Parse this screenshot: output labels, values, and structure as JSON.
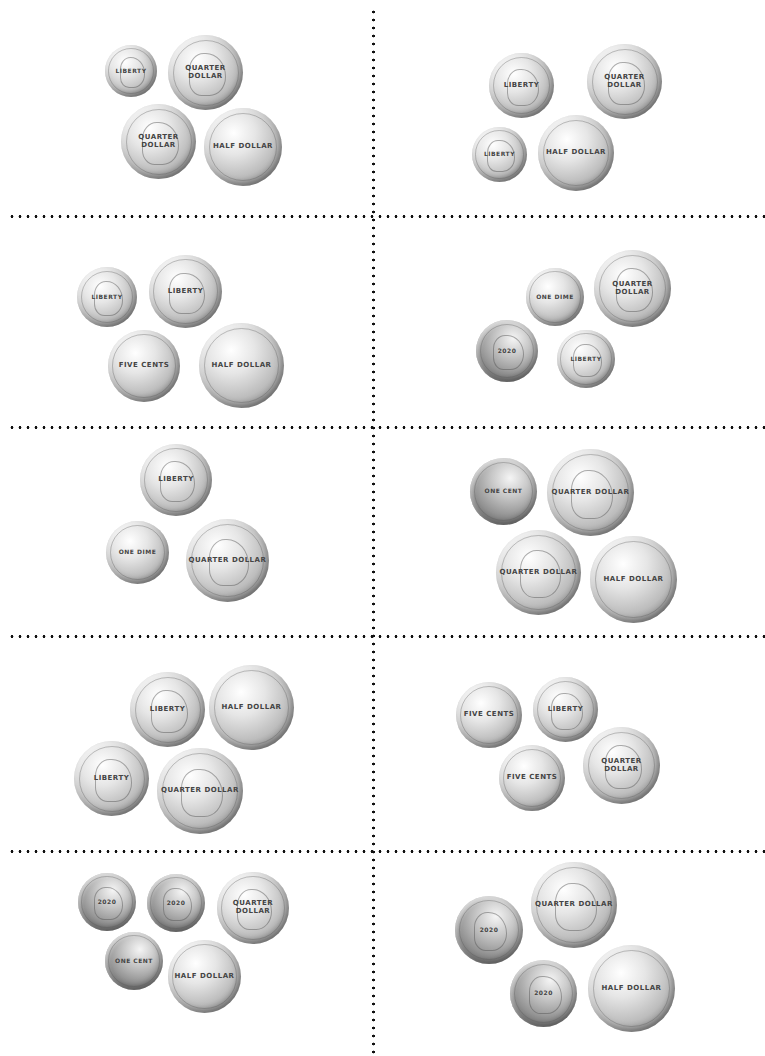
{
  "worksheet": {
    "title": "Coin counting cut-out cards",
    "grid": {
      "columns": 2,
      "rows": 5
    },
    "divider_style": "dotted",
    "colors": {
      "background": "#ffffff",
      "divider": "#111111",
      "coin_silver": "#bdbdbd"
    }
  },
  "coin_labels": {
    "penny_heads": "2020",
    "penny_tails": "ONE CENT",
    "nickel_heads": "Liberty 2020",
    "nickel_tails": "FIVE CENTS",
    "dime_heads": "LIBERTY",
    "dime_tails": "ONE DIME",
    "quarter_heads": "UNITED STATES QUARTER DOLLAR",
    "half_tails": "UNITED STATES HALF DOLLAR"
  },
  "cards": [
    {
      "id": 1,
      "coins": [
        {
          "type": "dime",
          "side": "heads",
          "label": "LIBERTY",
          "x": 105,
          "y": 45,
          "d": 52
        },
        {
          "type": "quarter",
          "side": "heads",
          "label": "QUARTER DOLLAR",
          "x": 168,
          "y": 35,
          "d": 75
        },
        {
          "type": "quarter",
          "side": "heads",
          "label": "QUARTER DOLLAR",
          "x": 121,
          "y": 104,
          "d": 75
        },
        {
          "type": "half",
          "side": "tails",
          "label": "HALF DOLLAR",
          "x": 204,
          "y": 108,
          "d": 78
        }
      ]
    },
    {
      "id": 2,
      "coins": [
        {
          "type": "nickel",
          "side": "heads",
          "label": "Liberty",
          "x": 489,
          "y": 53,
          "d": 65
        },
        {
          "type": "quarter",
          "side": "heads",
          "label": "QUARTER DOLLAR",
          "x": 587,
          "y": 44,
          "d": 75
        },
        {
          "type": "dime",
          "side": "heads",
          "label": "LIBERTY",
          "x": 472,
          "y": 127,
          "d": 55
        },
        {
          "type": "half",
          "side": "tails",
          "label": "HALF DOLLAR",
          "x": 538,
          "y": 115,
          "d": 76
        }
      ]
    },
    {
      "id": 3,
      "coins": [
        {
          "type": "dime",
          "side": "heads",
          "label": "LIBERTY",
          "x": 77,
          "y": 267,
          "d": 60
        },
        {
          "type": "nickel",
          "side": "heads",
          "label": "Liberty",
          "x": 149,
          "y": 255,
          "d": 73
        },
        {
          "type": "nickel",
          "side": "tails",
          "label": "FIVE CENTS",
          "x": 108,
          "y": 330,
          "d": 72
        },
        {
          "type": "half",
          "side": "tails",
          "label": "HALF DOLLAR",
          "x": 199,
          "y": 323,
          "d": 85
        }
      ]
    },
    {
      "id": 4,
      "coins": [
        {
          "type": "dime",
          "side": "tails",
          "label": "ONE DIME",
          "x": 526,
          "y": 268,
          "d": 58
        },
        {
          "type": "quarter",
          "side": "heads",
          "label": "QUARTER DOLLAR",
          "x": 594,
          "y": 250,
          "d": 77
        },
        {
          "type": "penny",
          "side": "heads",
          "label": "2020",
          "x": 476,
          "y": 320,
          "d": 62
        },
        {
          "type": "dime",
          "side": "heads",
          "label": "LIBERTY",
          "x": 557,
          "y": 330,
          "d": 58
        }
      ]
    },
    {
      "id": 5,
      "coins": [
        {
          "type": "nickel",
          "side": "heads",
          "label": "Liberty",
          "x": 140,
          "y": 444,
          "d": 72
        },
        {
          "type": "dime",
          "side": "tails",
          "label": "ONE DIME",
          "x": 106,
          "y": 521,
          "d": 63
        },
        {
          "type": "quarter",
          "side": "heads",
          "label": "QUARTER DOLLAR",
          "x": 186,
          "y": 519,
          "d": 83
        }
      ]
    },
    {
      "id": 6,
      "coins": [
        {
          "type": "penny",
          "side": "tails",
          "label": "ONE CENT",
          "x": 470,
          "y": 458,
          "d": 67
        },
        {
          "type": "quarter",
          "side": "heads",
          "label": "QUARTER DOLLAR",
          "x": 547,
          "y": 449,
          "d": 87
        },
        {
          "type": "quarter",
          "side": "heads",
          "label": "QUARTER DOLLAR",
          "x": 496,
          "y": 530,
          "d": 85
        },
        {
          "type": "half",
          "side": "tails",
          "label": "HALF DOLLAR",
          "x": 590,
          "y": 536,
          "d": 87
        }
      ]
    },
    {
      "id": 7,
      "coins": [
        {
          "type": "nickel",
          "side": "heads",
          "label": "Liberty",
          "x": 130,
          "y": 672,
          "d": 75
        },
        {
          "type": "half",
          "side": "tails",
          "label": "HALF DOLLAR",
          "x": 209,
          "y": 665,
          "d": 85
        },
        {
          "type": "nickel",
          "side": "heads",
          "label": "Liberty",
          "x": 74,
          "y": 741,
          "d": 75
        },
        {
          "type": "quarter",
          "side": "heads",
          "label": "QUARTER DOLLAR",
          "x": 157,
          "y": 748,
          "d": 86
        }
      ]
    },
    {
      "id": 8,
      "coins": [
        {
          "type": "nickel",
          "side": "tails",
          "label": "FIVE CENTS",
          "x": 456,
          "y": 682,
          "d": 66
        },
        {
          "type": "nickel",
          "side": "heads",
          "label": "Liberty",
          "x": 533,
          "y": 677,
          "d": 65
        },
        {
          "type": "nickel",
          "side": "tails",
          "label": "FIVE CENTS",
          "x": 499,
          "y": 745,
          "d": 66
        },
        {
          "type": "quarter",
          "side": "heads",
          "label": "QUARTER DOLLAR",
          "x": 583,
          "y": 727,
          "d": 77
        }
      ]
    },
    {
      "id": 9,
      "coins": [
        {
          "type": "penny",
          "side": "heads",
          "label": "2020",
          "x": 78,
          "y": 873,
          "d": 58
        },
        {
          "type": "penny",
          "side": "heads",
          "label": "2020",
          "x": 147,
          "y": 874,
          "d": 58
        },
        {
          "type": "quarter",
          "side": "heads",
          "label": "QUARTER DOLLAR",
          "x": 217,
          "y": 872,
          "d": 72
        },
        {
          "type": "penny",
          "side": "tails",
          "label": "ONE CENT",
          "x": 105,
          "y": 932,
          "d": 58
        },
        {
          "type": "half",
          "side": "tails",
          "label": "HALF DOLLAR",
          "x": 168,
          "y": 940,
          "d": 73
        }
      ]
    },
    {
      "id": 10,
      "coins": [
        {
          "type": "penny",
          "side": "heads",
          "label": "2020",
          "x": 455,
          "y": 896,
          "d": 68
        },
        {
          "type": "quarter",
          "side": "heads",
          "label": "QUARTER DOLLAR",
          "x": 531,
          "y": 862,
          "d": 86
        },
        {
          "type": "penny",
          "side": "heads",
          "label": "2020",
          "x": 510,
          "y": 960,
          "d": 67
        },
        {
          "type": "half",
          "side": "tails",
          "label": "HALF DOLLAR",
          "x": 588,
          "y": 945,
          "d": 87
        }
      ]
    }
  ],
  "dividers": {
    "vertical_x": 373,
    "horizontal_y": [
      217,
      428,
      637,
      852
    ]
  }
}
